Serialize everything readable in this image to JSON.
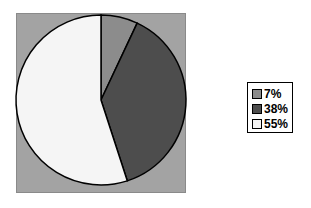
{
  "chart_data": {
    "type": "pie",
    "title": "",
    "categories": [
      "7%",
      "38%",
      "55%"
    ],
    "values": [
      7,
      38,
      55
    ],
    "colors": [
      "#8c8c8c",
      "#4d4d4d",
      "#f5f5f5"
    ],
    "plot_background": "#a3a3a3",
    "legend_position": "right",
    "start_angle_deg": 0,
    "direction": "clockwise"
  },
  "legend": {
    "items": [
      {
        "label": "7%",
        "color": "#8c8c8c"
      },
      {
        "label": "38%",
        "color": "#4d4d4d"
      },
      {
        "label": "55%",
        "color": "#f5f5f5"
      }
    ]
  }
}
